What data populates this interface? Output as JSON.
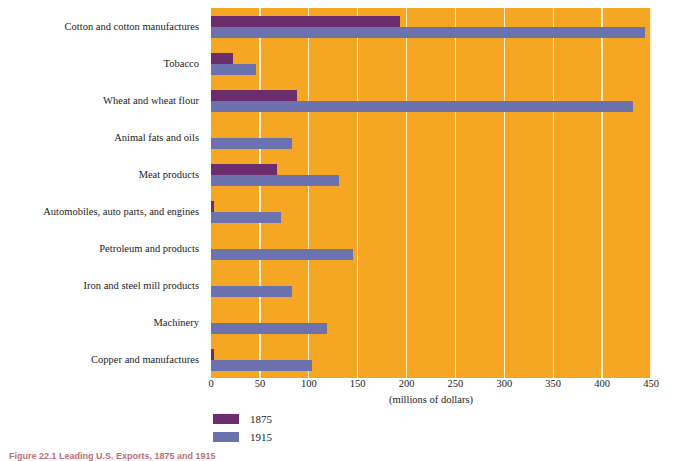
{
  "caption": "Figure 22.1 Leading U.S. Exports, 1875 and 1915",
  "legend": {
    "items": [
      {
        "label": "1875",
        "color": "#6c2d6e",
        "swatch_name": "legend-swatch-1875"
      },
      {
        "label": "1915",
        "color": "#6b72ae",
        "swatch_name": "legend-swatch-1915"
      }
    ]
  },
  "colors": {
    "plot_background": "#f5a623",
    "gridline": "#fdf0cf",
    "series_1875": "#6c2d6e",
    "series_1915": "#6b72ae",
    "text": "#1b1b22",
    "caption": "#b8707a"
  },
  "chart_data": {
    "type": "bar",
    "orientation": "horizontal",
    "title": "Figure 22.1 Leading U.S. Exports, 1875 and 1915",
    "xlabel": "(millions of dollars)",
    "ylabel": "",
    "xlim": [
      0,
      450
    ],
    "xticks": [
      0,
      50,
      100,
      150,
      200,
      250,
      300,
      350,
      400,
      450
    ],
    "xtick_labels": [
      "0",
      "50",
      "100",
      "150",
      "200",
      "250",
      "300",
      "350",
      "400",
      "450"
    ],
    "grid": true,
    "grid_axis": "x",
    "legend_position": "bottom-left",
    "categories": [
      "Cotton and cotton manufactures",
      "Tobacco",
      "Wheat and wheat flour",
      "Animal fats and oils",
      "Meat products",
      "Automobiles, auto parts, and engines",
      "Petroleum and products",
      "Iron and steel mill products",
      "Machinery",
      "Copper and manufactures"
    ],
    "series": [
      {
        "name": "1875",
        "color": "#6c2d6e",
        "values": [
          193,
          23,
          88,
          0,
          67,
          2,
          0,
          0,
          0,
          2
        ]
      },
      {
        "name": "1915",
        "color": "#6b72ae",
        "values": [
          444,
          46,
          432,
          83,
          131,
          72,
          145,
          83,
          119,
          103
        ]
      }
    ],
    "units": "millions of dollars"
  }
}
